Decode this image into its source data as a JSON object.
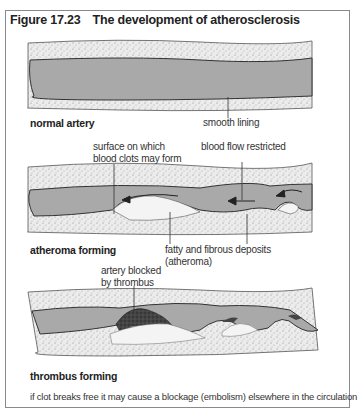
{
  "figure": {
    "number": "Figure 17.23",
    "title": "The development of atherosclerosis"
  },
  "panels": [
    {
      "caption": "normal artery",
      "labels": [
        "smooth lining"
      ]
    },
    {
      "caption": "atheroma forming",
      "labels": [
        "surface on which",
        "blood clots may form",
        "blood flow restricted",
        "fatty and fibrous deposits",
        "(atheroma)"
      ]
    },
    {
      "caption": "thrombus forming",
      "labels": [
        "artery blocked",
        "by thrombus"
      ]
    }
  ],
  "footnote": "if clot breaks free it may cause a blockage (embolism) elsewhere in the circulation",
  "colors": {
    "lumen": "#a9a9a9",
    "wall_stipple": "#e8e8e8",
    "deposit": "#f4f4f4",
    "thrombus": "#3a3a3a",
    "border": "#8a8a8a"
  }
}
